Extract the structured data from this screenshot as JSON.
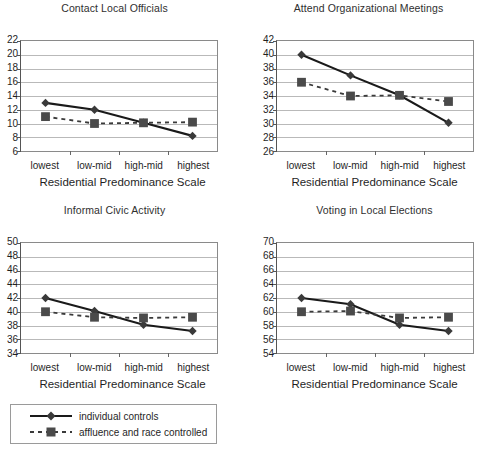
{
  "figure": {
    "axis_title": "Residential Predominance Scale",
    "categories": [
      "lowest",
      "low-mid",
      "high-mid",
      "highest"
    ],
    "series_names": [
      "individual controls",
      "affluence and race controlled"
    ],
    "colors": {
      "line": "#1a1a1a",
      "marker": "#3a3a3a",
      "grid": "#b9b9b9",
      "frame": "#8a8a8a",
      "text": "#1f1f1f"
    }
  },
  "legend": {
    "items": [
      {
        "label": "individual controls",
        "marker": "diamond",
        "style": "solid"
      },
      {
        "label": "affluence and race controlled",
        "marker": "square",
        "style": "dashed"
      }
    ]
  },
  "chart_data": [
    {
      "type": "line",
      "title": "Contact Local Officials",
      "xlabel": "Residential Predominance Scale",
      "ylabel": "",
      "categories": [
        "lowest",
        "low-mid",
        "high-mid",
        "highest"
      ],
      "yticks": [
        22,
        20,
        18,
        16,
        14,
        12,
        10,
        8,
        6
      ],
      "ylim": [
        6,
        22
      ],
      "grid": true,
      "legend_position": "below-figure",
      "series": [
        {
          "name": "individual controls",
          "marker": "diamond",
          "style": "solid",
          "values": [
            13.0,
            12.0,
            10.1,
            8.2
          ]
        },
        {
          "name": "affluence and race controlled",
          "marker": "square",
          "style": "dashed",
          "values": [
            11.0,
            10.0,
            10.1,
            10.2
          ]
        }
      ]
    },
    {
      "type": "line",
      "title": "Attend Organizational Meetings",
      "xlabel": "Residential Predominance Scale",
      "ylabel": "",
      "categories": [
        "lowest",
        "low-mid",
        "high-mid",
        "highest"
      ],
      "yticks": [
        42,
        40,
        38,
        36,
        34,
        32,
        30,
        28,
        26
      ],
      "ylim": [
        26,
        42
      ],
      "grid": true,
      "legend_position": "below-figure",
      "series": [
        {
          "name": "individual controls",
          "marker": "diamond",
          "style": "solid",
          "values": [
            40.0,
            37.0,
            34.1,
            30.1
          ]
        },
        {
          "name": "affluence and race controlled",
          "marker": "square",
          "style": "dashed",
          "values": [
            36.0,
            34.0,
            34.1,
            33.2
          ]
        }
      ]
    },
    {
      "type": "line",
      "title": "Informal Civic Activity",
      "xlabel": "Residential Predominance Scale",
      "ylabel": "",
      "categories": [
        "lowest",
        "low-mid",
        "high-mid",
        "highest"
      ],
      "yticks": [
        50,
        48,
        46,
        44,
        42,
        40,
        38,
        36,
        34
      ],
      "ylim": [
        34,
        50
      ],
      "grid": true,
      "legend_position": "below-figure",
      "series": [
        {
          "name": "individual controls",
          "marker": "diamond",
          "style": "solid",
          "values": [
            42.0,
            40.1,
            38.1,
            37.2
          ]
        },
        {
          "name": "affluence and race controlled",
          "marker": "square",
          "style": "dashed",
          "values": [
            40.0,
            39.2,
            39.1,
            39.2
          ]
        }
      ]
    },
    {
      "type": "line",
      "title": "Voting in Local Elections",
      "xlabel": "Residential Predominance Scale",
      "ylabel": "",
      "categories": [
        "lowest",
        "low-mid",
        "high-mid",
        "highest"
      ],
      "yticks": [
        70,
        68,
        66,
        64,
        62,
        60,
        58,
        56,
        54
      ],
      "ylim": [
        54,
        70
      ],
      "grid": true,
      "legend_position": "below-figure",
      "series": [
        {
          "name": "individual controls",
          "marker": "diamond",
          "style": "solid",
          "values": [
            62.0,
            61.1,
            58.1,
            57.2
          ]
        },
        {
          "name": "affluence and race controlled",
          "marker": "square",
          "style": "dashed",
          "values": [
            60.0,
            60.1,
            59.1,
            59.2
          ]
        }
      ]
    }
  ]
}
